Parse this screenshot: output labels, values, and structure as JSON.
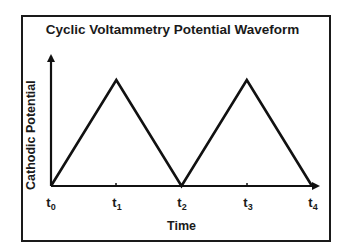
{
  "chart_data": {
    "type": "line",
    "title": "Cyclic Voltammetry Potential Waveform",
    "xlabel": "Time",
    "ylabel": "Cathodic Potential",
    "x_ticks": [
      {
        "base": "t",
        "sub": "0"
      },
      {
        "base": "t",
        "sub": "1"
      },
      {
        "base": "t",
        "sub": "2"
      },
      {
        "base": "t",
        "sub": "3"
      },
      {
        "base": "t",
        "sub": "4"
      }
    ],
    "x": [
      0,
      1,
      2,
      3,
      4
    ],
    "series": [
      {
        "name": "Potential",
        "values": [
          0,
          1,
          0,
          1,
          0
        ]
      }
    ],
    "grid": false,
    "legend": "none",
    "color": "#111111"
  }
}
